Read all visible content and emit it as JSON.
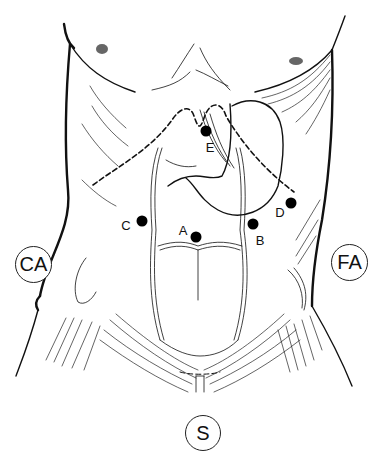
{
  "figure": {
    "type": "anatomical-illustration",
    "point_labels": [
      {
        "id": "A",
        "label": "A",
        "dot": [
          196,
          237
        ],
        "text": [
          183,
          230
        ]
      },
      {
        "id": "B",
        "label": "B",
        "dot": [
          253,
          224
        ],
        "text": [
          260,
          240
        ]
      },
      {
        "id": "C",
        "label": "C",
        "dot": [
          142,
          221
        ],
        "text": [
          126,
          225
        ]
      },
      {
        "id": "D",
        "label": "D",
        "dot": [
          291,
          203
        ],
        "text": [
          280,
          212
        ]
      },
      {
        "id": "E",
        "label": "E",
        "dot": [
          206,
          131
        ],
        "text": [
          210,
          147
        ]
      }
    ],
    "region_labels": [
      {
        "id": "CA",
        "label": "CA",
        "center": [
          33,
          264
        ]
      },
      {
        "id": "FA",
        "label": "FA",
        "center": [
          350,
          262
        ]
      },
      {
        "id": "S",
        "label": "S",
        "center": [
          203,
          433
        ]
      }
    ],
    "colors": {
      "ink": "#111111",
      "background": "#ffffff"
    }
  }
}
